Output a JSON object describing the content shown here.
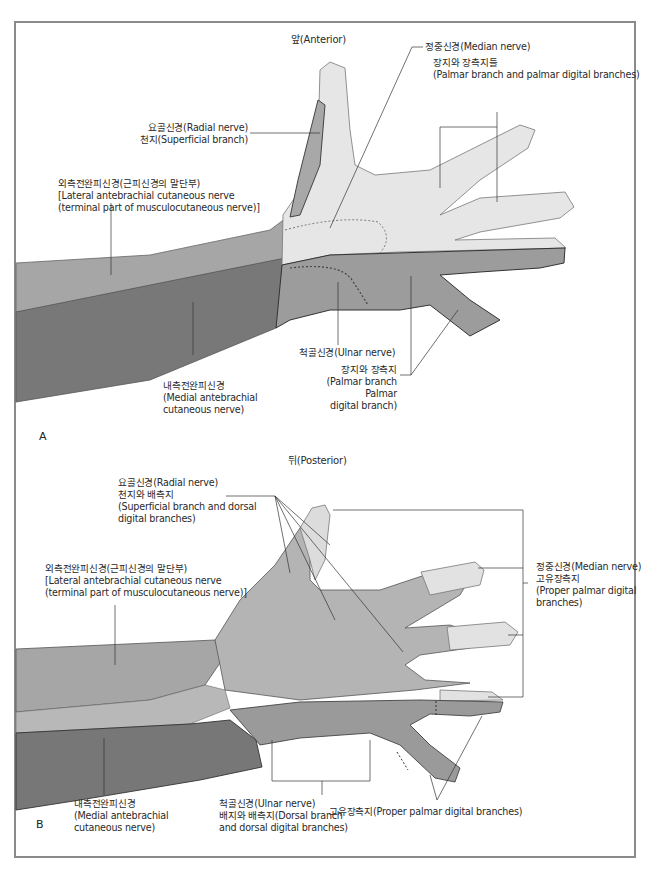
{
  "figure": {
    "panel_a": {
      "letter": "A",
      "title": "앞(Anterior)",
      "labels": {
        "radial": "요골신경(Radial nerve)\n천지(Superficial branch)",
        "lateral_antebrachial": "외측전완피신경(근피신경의 말단부)\n[Lateral antebrachial cutaneous nerve\n(terminal part of musculocutaneous nerve)]",
        "median": "정중신경(Median nerve)",
        "median_branches": "장지와 장측지들\n(Palmar branch and palmar digital branches)",
        "ulnar": "척골신경(Ulnar nerve)",
        "ulnar_branches": "장지와 장측지\n(Palmar branch Palmar\ndigital branch)",
        "medial_antebrachial": "내측전완피신경\n(Medial antebrachial\ncutaneous nerve)"
      }
    },
    "panel_b": {
      "letter": "B",
      "title": "뒤(Posterior)",
      "labels": {
        "radial": "요골신경(Radial nerve)\n천지와 배측지\n(Superficial branch and dorsal\ndigital branches)",
        "lateral_antebrachial": "외측전완피신경(근피신경의 말단부)\n[Lateral antebrachial cutaneous nerve\n(terminal part of musculocutaneous nerve)]",
        "median": "정중신경(Median nerve)\n고유장측지\n(Proper palmar digital\nbranches)",
        "ulnar": "척골신경(Ulnar nerve)\n배지와 배측지(Dorsal branch\nand dorsal digital branches)",
        "ulnar_proper": "고유장측지(Proper palmar digital branches)",
        "medial_antebrachial": "내측전완피신경\n(Medial antebrachial\ncutaneous nerve)"
      }
    },
    "colors": {
      "frame": "#8a8a8a",
      "median_zone": "#e9e9e9",
      "radial_zone": "#a8a8a8",
      "lateral_zone": "#a6a6a6",
      "medial_zone": "#7a7a7a",
      "ulnar_zone": "#9c9c9c",
      "dorsal_hand": "#b3b3b3"
    }
  }
}
